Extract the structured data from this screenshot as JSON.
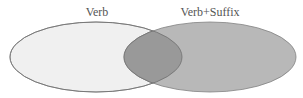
{
  "diagram": {
    "type": "venn",
    "sets": [
      {
        "label": "Verb",
        "fill": "#f0f0f0",
        "stroke": "#808080",
        "cx": 96,
        "cy": 57,
        "rx": 86,
        "ry": 35,
        "label_x": 97,
        "label_y": 16
      },
      {
        "label": "Verb+Suffix",
        "fill": "#b8b8b8",
        "stroke": "#808080",
        "cx": 210,
        "cy": 57,
        "rx": 86,
        "ry": 35,
        "label_x": 210,
        "label_y": 16
      }
    ],
    "intersection": {
      "fill": "#999999",
      "stroke": "#707070"
    }
  }
}
